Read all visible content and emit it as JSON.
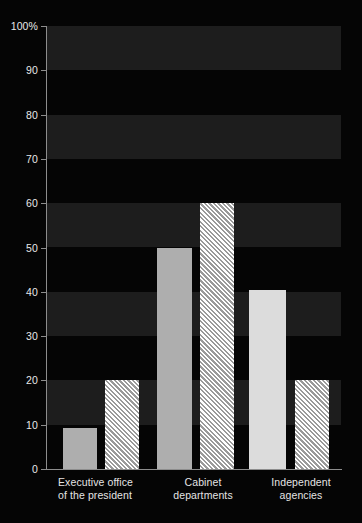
{
  "chart_data": {
    "type": "bar",
    "title": "",
    "subtitle": "",
    "xlabel": "",
    "ylabel": "",
    "ylim": [
      0,
      100
    ],
    "y_unit": "%",
    "grid": "alternating horizontal bands every 10 units",
    "legend_position": "none",
    "categories": [
      "Executive office\nof the president",
      "Cabinet\ndepartments",
      "Independent\nagencies"
    ],
    "y_ticks": [
      "0",
      "10",
      "20",
      "30",
      "40",
      "50",
      "60",
      "70",
      "80",
      "90",
      "100%"
    ],
    "y_tick_values": [
      0,
      10,
      20,
      30,
      40,
      50,
      60,
      70,
      80,
      90,
      100
    ],
    "series": [
      {
        "name": "series-1-solid",
        "style": "solid",
        "values": [
          9.2,
          50,
          40.4
        ]
      },
      {
        "name": "series-2-hatched",
        "style": "diagonal-hatch",
        "values": [
          20,
          60,
          20
        ]
      }
    ],
    "bars": [
      {
        "category": 0,
        "series": 0,
        "value": 9.2,
        "fill": "solid-mid",
        "x": 16,
        "width": 34
      },
      {
        "category": 0,
        "series": 1,
        "value": 20,
        "fill": "hatched",
        "x": 58,
        "width": 34
      },
      {
        "category": 1,
        "series": 0,
        "value": 50,
        "fill": "solid-mid",
        "x": 110,
        "width": 35
      },
      {
        "category": 1,
        "series": 1,
        "value": 60,
        "fill": "hatched",
        "x": 153,
        "width": 34
      },
      {
        "category": 2,
        "series": 0,
        "value": 40.4,
        "fill": "solid-light",
        "x": 202,
        "width": 37
      },
      {
        "category": 2,
        "series": 1,
        "value": 20,
        "fill": "hatched",
        "x": 248,
        "width": 34
      }
    ],
    "colors": {
      "background": "#050505",
      "band": "#1d1d1d",
      "axis": "#8d8d8d",
      "text": "#e8e8e8",
      "bar_solid_mid": "#aeaeae",
      "bar_solid_light": "#dcdcdc",
      "bar_hatch_base": "#e2e2e2"
    }
  }
}
